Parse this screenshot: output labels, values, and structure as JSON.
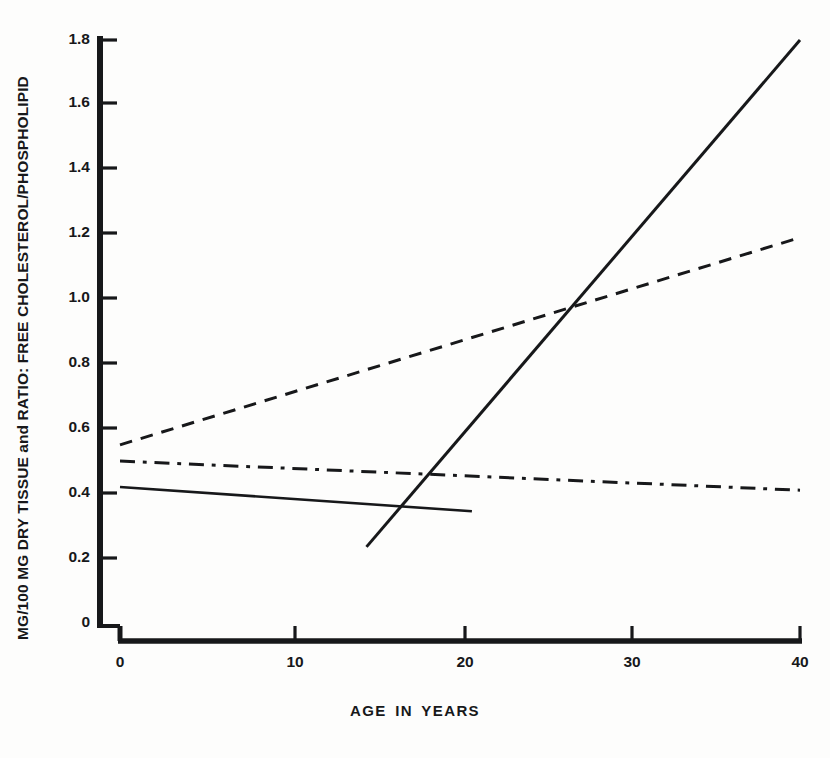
{
  "chart_data": {
    "type": "line",
    "title": "",
    "xlabel": "AGE IN YEARS",
    "ylabel": "MG/100 MG DRY TISSUE and RATIO:  FREE CHOLESTEROL/PHOSPHOLIPID",
    "xlim": [
      0,
      40
    ],
    "ylim": [
      0,
      1.8
    ],
    "grid": false,
    "legend": "none",
    "xticks": [
      0,
      10,
      20,
      30,
      40
    ],
    "xtick_labels": [
      "0",
      "10",
      "20",
      "30",
      "40"
    ],
    "yticks": [
      0,
      0.2,
      0.4,
      0.6,
      0.8,
      1.0,
      1.2,
      1.4,
      1.6,
      1.8
    ],
    "ytick_labels": [
      "0",
      "0.2",
      "0.4",
      "0.6",
      "0.8",
      "1.0",
      "1.2",
      "1.4",
      "1.6",
      "1.8"
    ],
    "series": [
      {
        "name": "steep-rising-solid",
        "style": "solid",
        "color": "#17181a",
        "width": 3.0,
        "x": [
          14.5,
          40.0
        ],
        "y": [
          0.235,
          1.8
        ]
      },
      {
        "name": "rising-dashed",
        "style": "dashed",
        "color": "#17181a",
        "width": 3.0,
        "x": [
          0.0,
          40.0
        ],
        "y": [
          0.55,
          1.19
        ]
      },
      {
        "name": "flat-dash-dot",
        "style": "dash-dot",
        "color": "#17181a",
        "width": 3.0,
        "x": [
          0.0,
          40.0
        ],
        "y": [
          0.5,
          0.41
        ]
      },
      {
        "name": "short-declining-solid",
        "style": "solid",
        "color": "#17181a",
        "width": 2.6,
        "x": [
          0.0,
          20.7
        ],
        "y": [
          0.42,
          0.345
        ]
      }
    ],
    "annotations": [],
    "axis_color": "#17181a"
  },
  "axes": {
    "x_tick_positions_px": [
      120,
      295,
      465,
      632,
      800
    ],
    "y_tick_positions_px": [
      623,
      558,
      493,
      428,
      363,
      298,
      233,
      168,
      103,
      40
    ],
    "x_label": "AGE IN YEARS",
    "y_label": "MG/100 MG DRY TISSUE and RATIO:  FREE CHOLESTEROL/PHOSPHOLIPID"
  }
}
